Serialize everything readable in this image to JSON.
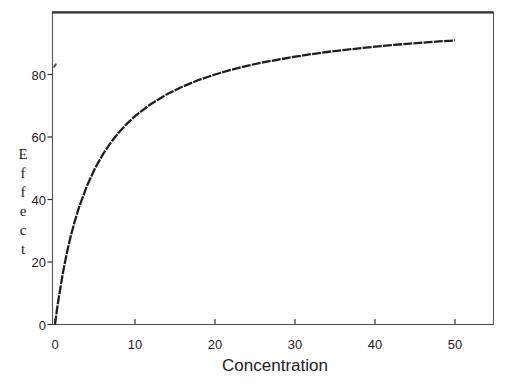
{
  "chart_data": {
    "type": "line",
    "title": "",
    "xlabel": "Concentration",
    "ylabel": "Effect",
    "x_ticks": [
      0,
      10,
      20,
      30,
      40,
      50
    ],
    "y_ticks": [
      0,
      20,
      40,
      60,
      80
    ],
    "xlim": [
      0,
      55
    ],
    "ylim": [
      0,
      100
    ],
    "grid": false,
    "legend": null,
    "series": [
      {
        "name": "effect-vs-concentration-curve",
        "x": [
          0,
          0.25,
          0.5,
          1,
          1.5,
          2,
          2.5,
          3,
          4,
          5,
          6,
          7,
          8,
          9,
          10,
          12,
          14,
          16,
          18,
          20,
          22,
          24,
          26,
          28,
          30,
          32,
          34,
          36,
          38,
          40,
          42,
          44,
          46,
          48,
          50
        ],
        "y": [
          0,
          4.8,
          9.1,
          16.7,
          23.1,
          28.6,
          33.3,
          37.5,
          44.4,
          50,
          54.5,
          58.3,
          61.5,
          64.3,
          66.7,
          70.6,
          73.7,
          76.2,
          78.3,
          80,
          81.5,
          82.8,
          83.9,
          84.8,
          85.7,
          86.5,
          87.2,
          87.8,
          88.4,
          88.9,
          89.4,
          89.8,
          90.2,
          90.6,
          90.9
        ]
      }
    ]
  },
  "colors": {
    "curve": "#1f1f1f",
    "frame": "#555555",
    "frame_top": "#2e2e2e",
    "tick": "#333333",
    "text": "#1c1c1c",
    "background": "#ffffff"
  }
}
